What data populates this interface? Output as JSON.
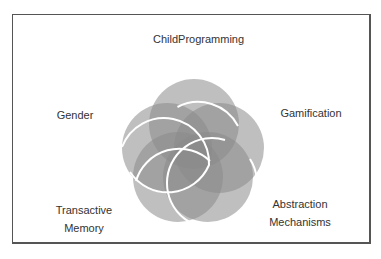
{
  "diagram": {
    "type": "five-set venn (flower)",
    "sets": [
      {
        "id": "top",
        "label": "ChildProgramming"
      },
      {
        "id": "left",
        "label": "Gender"
      },
      {
        "id": "right",
        "label": "Gamification"
      },
      {
        "id": "bottom-left",
        "label_line1": "Transactive",
        "label_line2": "Memory"
      },
      {
        "id": "bottom-right",
        "label_line1": "Abstraction",
        "label_line2": "Mechanisms"
      }
    ],
    "colors": {
      "circle_fill": "#8c8c8c",
      "circle_stroke": "#ffffff",
      "frame_border": "#555555",
      "text": "#333333"
    }
  }
}
